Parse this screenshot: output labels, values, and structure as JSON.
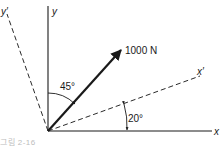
{
  "diagram": {
    "type": "force-vector-axes",
    "axes": {
      "x_label": "x",
      "y_label": "y",
      "x_prime_label": "x′",
      "y_prime_label": "y′"
    },
    "force": {
      "label": "1000 N",
      "angle_from_y_label": "45°"
    },
    "rotation": {
      "angle_label": "20°"
    },
    "colors": {
      "line": "#1a1a1a",
      "dashed": "#2a2a2a"
    }
  },
  "caption": {
    "text": "그림 2-16"
  }
}
